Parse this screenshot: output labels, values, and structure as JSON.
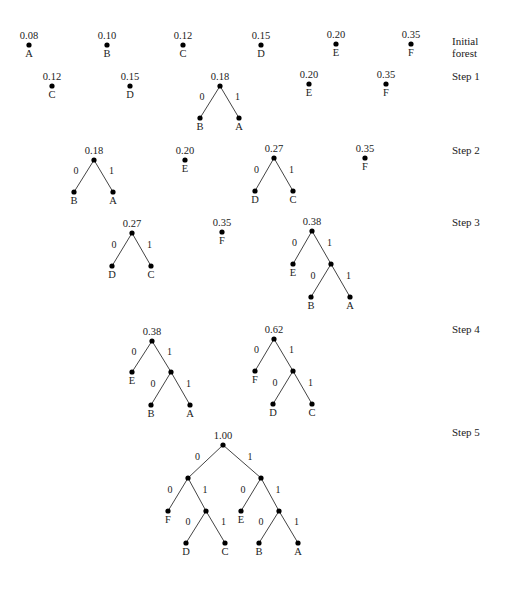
{
  "figure": {
    "node_color": "#000000",
    "edge_color": "#444444",
    "text_color": "#222222"
  },
  "step_labels": [
    {
      "text": "Initial",
      "text2": "forest",
      "x": 452,
      "y": 35
    },
    {
      "text": "Step 1",
      "text2": "",
      "x": 452,
      "y": 70
    },
    {
      "text": "Step 2",
      "text2": "",
      "x": 452,
      "y": 144
    },
    {
      "text": "Step 3",
      "text2": "",
      "x": 452,
      "y": 216
    },
    {
      "text": "Step 4",
      "text2": "",
      "x": 452,
      "y": 323
    },
    {
      "text": "Step 5",
      "text2": "",
      "x": 452,
      "y": 426
    }
  ],
  "steps": [
    {
      "name": "initial-forest",
      "nodes": [
        {
          "id": "A0",
          "x": 29,
          "y": 45,
          "weight": "0.08",
          "symbol": "A"
        },
        {
          "id": "B0",
          "x": 107,
          "y": 45,
          "weight": "0.10",
          "symbol": "B"
        },
        {
          "id": "C0",
          "x": 183,
          "y": 45,
          "weight": "0.12",
          "symbol": "C"
        },
        {
          "id": "D0",
          "x": 261,
          "y": 45,
          "weight": "0.15",
          "symbol": "D"
        },
        {
          "id": "E0",
          "x": 336,
          "y": 44,
          "weight": "0.20",
          "symbol": "E"
        },
        {
          "id": "F0",
          "x": 411,
          "y": 44,
          "weight": "0.35",
          "symbol": "F"
        }
      ],
      "edges": []
    },
    {
      "name": "step-1",
      "nodes": [
        {
          "id": "C1",
          "x": 52,
          "y": 86,
          "weight": "0.12",
          "symbol": "C"
        },
        {
          "id": "D1",
          "x": 130,
          "y": 86,
          "weight": "0.15",
          "symbol": "D"
        },
        {
          "id": "R1",
          "x": 220,
          "y": 86,
          "weight": "0.18",
          "symbol": ""
        },
        {
          "id": "B1",
          "x": 200,
          "y": 118,
          "weight": "",
          "symbol": "B"
        },
        {
          "id": "A1",
          "x": 239,
          "y": 118,
          "weight": "",
          "symbol": "A"
        },
        {
          "id": "E1",
          "x": 309,
          "y": 84,
          "weight": "0.20",
          "symbol": "E"
        },
        {
          "id": "F1",
          "x": 386,
          "y": 84,
          "weight": "0.35",
          "symbol": "F"
        }
      ],
      "edges": [
        {
          "from": "R1",
          "to": "B1",
          "bit": "0"
        },
        {
          "from": "R1",
          "to": "A1",
          "bit": "1"
        }
      ]
    },
    {
      "name": "step-2",
      "nodes": [
        {
          "id": "R2a",
          "x": 94,
          "y": 160,
          "weight": "0.18",
          "symbol": ""
        },
        {
          "id": "B2",
          "x": 74,
          "y": 192,
          "weight": "",
          "symbol": "B"
        },
        {
          "id": "A2",
          "x": 113,
          "y": 192,
          "weight": "",
          "symbol": "A"
        },
        {
          "id": "E2",
          "x": 185,
          "y": 160,
          "weight": "0.20",
          "symbol": "E"
        },
        {
          "id": "R2b",
          "x": 274,
          "y": 158,
          "weight": "0.27",
          "symbol": ""
        },
        {
          "id": "D2",
          "x": 255,
          "y": 191,
          "weight": "",
          "symbol": "D"
        },
        {
          "id": "C2",
          "x": 293,
          "y": 191,
          "weight": "",
          "symbol": "C"
        },
        {
          "id": "F2",
          "x": 365,
          "y": 158,
          "weight": "0.35",
          "symbol": "F"
        }
      ],
      "edges": [
        {
          "from": "R2a",
          "to": "B2",
          "bit": "0"
        },
        {
          "from": "R2a",
          "to": "A2",
          "bit": "1"
        },
        {
          "from": "R2b",
          "to": "D2",
          "bit": "0"
        },
        {
          "from": "R2b",
          "to": "C2",
          "bit": "1"
        }
      ]
    },
    {
      "name": "step-3",
      "nodes": [
        {
          "id": "R3a",
          "x": 132,
          "y": 233,
          "weight": "0.27",
          "symbol": ""
        },
        {
          "id": "D3",
          "x": 112,
          "y": 266,
          "weight": "",
          "symbol": "D"
        },
        {
          "id": "C3",
          "x": 151,
          "y": 266,
          "weight": "",
          "symbol": "C"
        },
        {
          "id": "F3",
          "x": 222,
          "y": 232,
          "weight": "0.35",
          "symbol": "F"
        },
        {
          "id": "R3b",
          "x": 312,
          "y": 231,
          "weight": "0.38",
          "symbol": ""
        },
        {
          "id": "E3",
          "x": 293,
          "y": 264,
          "weight": "",
          "symbol": "E"
        },
        {
          "id": "I3",
          "x": 331,
          "y": 264,
          "weight": "",
          "symbol": ""
        },
        {
          "id": "B3",
          "x": 311,
          "y": 297,
          "weight": "",
          "symbol": "B"
        },
        {
          "id": "A3",
          "x": 350,
          "y": 297,
          "weight": "",
          "symbol": "A"
        }
      ],
      "edges": [
        {
          "from": "R3a",
          "to": "D3",
          "bit": "0"
        },
        {
          "from": "R3a",
          "to": "C3",
          "bit": "1"
        },
        {
          "from": "R3b",
          "to": "E3",
          "bit": "0"
        },
        {
          "from": "R3b",
          "to": "I3",
          "bit": "1"
        },
        {
          "from": "I3",
          "to": "B3",
          "bit": "0"
        },
        {
          "from": "I3",
          "to": "A3",
          "bit": "1"
        }
      ]
    },
    {
      "name": "step-4",
      "nodes": [
        {
          "id": "R4a",
          "x": 152,
          "y": 341,
          "weight": "0.38",
          "symbol": ""
        },
        {
          "id": "E4",
          "x": 132,
          "y": 372,
          "weight": "",
          "symbol": "E"
        },
        {
          "id": "I4a",
          "x": 171,
          "y": 372,
          "weight": "",
          "symbol": ""
        },
        {
          "id": "B4",
          "x": 151,
          "y": 405,
          "weight": "",
          "symbol": "B"
        },
        {
          "id": "A4",
          "x": 190,
          "y": 405,
          "weight": "",
          "symbol": "A"
        },
        {
          "id": "R4b",
          "x": 274,
          "y": 339,
          "weight": "0.62",
          "symbol": ""
        },
        {
          "id": "F4",
          "x": 255,
          "y": 371,
          "weight": "",
          "symbol": "F"
        },
        {
          "id": "I4b",
          "x": 293,
          "y": 371,
          "weight": "",
          "symbol": ""
        },
        {
          "id": "D4",
          "x": 273,
          "y": 404,
          "weight": "",
          "symbol": "D"
        },
        {
          "id": "C4",
          "x": 312,
          "y": 404,
          "weight": "",
          "symbol": "C"
        }
      ],
      "edges": [
        {
          "from": "R4a",
          "to": "E4",
          "bit": "0"
        },
        {
          "from": "R4a",
          "to": "I4a",
          "bit": "1"
        },
        {
          "from": "I4a",
          "to": "B4",
          "bit": "0"
        },
        {
          "from": "I4a",
          "to": "A4",
          "bit": "1"
        },
        {
          "from": "R4b",
          "to": "F4",
          "bit": "0"
        },
        {
          "from": "R4b",
          "to": "I4b",
          "bit": "1"
        },
        {
          "from": "I4b",
          "to": "D4",
          "bit": "0"
        },
        {
          "from": "I4b",
          "to": "C4",
          "bit": "1"
        }
      ]
    },
    {
      "name": "step-5",
      "nodes": [
        {
          "id": "R5",
          "x": 223,
          "y": 445,
          "weight": "1.00",
          "symbol": ""
        },
        {
          "id": "L5",
          "x": 188,
          "y": 478,
          "weight": "",
          "symbol": ""
        },
        {
          "id": "Rt5",
          "x": 261,
          "y": 478,
          "weight": "",
          "symbol": ""
        },
        {
          "id": "F5",
          "x": 168,
          "y": 511,
          "weight": "",
          "symbol": "F"
        },
        {
          "id": "LR5",
          "x": 206,
          "y": 511,
          "weight": "",
          "symbol": ""
        },
        {
          "id": "D5",
          "x": 186,
          "y": 543,
          "weight": "",
          "symbol": "D"
        },
        {
          "id": "C5",
          "x": 225,
          "y": 543,
          "weight": "",
          "symbol": "C"
        },
        {
          "id": "E5",
          "x": 241,
          "y": 511,
          "weight": "",
          "symbol": "E"
        },
        {
          "id": "RR5",
          "x": 279,
          "y": 511,
          "weight": "",
          "symbol": ""
        },
        {
          "id": "B5",
          "x": 259,
          "y": 543,
          "weight": "",
          "symbol": "B"
        },
        {
          "id": "A5",
          "x": 298,
          "y": 543,
          "weight": "",
          "symbol": "A"
        }
      ],
      "edges": [
        {
          "from": "R5",
          "to": "L5",
          "bit": "0"
        },
        {
          "from": "R5",
          "to": "Rt5",
          "bit": "1"
        },
        {
          "from": "L5",
          "to": "F5",
          "bit": "0"
        },
        {
          "from": "L5",
          "to": "LR5",
          "bit": "1"
        },
        {
          "from": "LR5",
          "to": "D5",
          "bit": "0"
        },
        {
          "from": "LR5",
          "to": "C5",
          "bit": "1"
        },
        {
          "from": "Rt5",
          "to": "E5",
          "bit": "0"
        },
        {
          "from": "Rt5",
          "to": "RR5",
          "bit": "1"
        },
        {
          "from": "RR5",
          "to": "B5",
          "bit": "0"
        },
        {
          "from": "RR5",
          "to": "A5",
          "bit": "1"
        }
      ]
    }
  ]
}
